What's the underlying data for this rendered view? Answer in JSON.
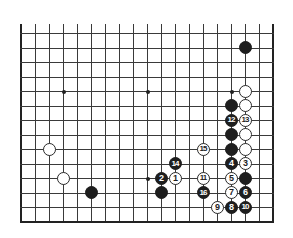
{
  "diagram": {
    "type": "go-board-partial",
    "board_size": 19,
    "visible_rows_from_bottom": 14,
    "colors": {
      "line": "#3a3a3a",
      "black": "#1e1e1e",
      "white": "#ffffff"
    },
    "star_points": [
      {
        "col": 4,
        "row": 10
      },
      {
        "col": 10,
        "row": 10
      },
      {
        "col": 16,
        "row": 10
      },
      {
        "col": 4,
        "row": 4
      },
      {
        "col": 10,
        "row": 4
      },
      {
        "col": 16,
        "row": 4
      }
    ],
    "stones": [
      {
        "color": "black",
        "col": 17,
        "row": 13,
        "label": ""
      },
      {
        "color": "white",
        "col": 17,
        "row": 10,
        "label": ""
      },
      {
        "color": "black",
        "col": 16,
        "row": 9,
        "label": ""
      },
      {
        "color": "white",
        "col": 17,
        "row": 9,
        "label": ""
      },
      {
        "color": "black",
        "col": 16,
        "row": 8,
        "label": "12"
      },
      {
        "color": "white",
        "col": 17,
        "row": 8,
        "label": "13"
      },
      {
        "color": "black",
        "col": 16,
        "row": 7,
        "label": ""
      },
      {
        "color": "white",
        "col": 17,
        "row": 7,
        "label": ""
      },
      {
        "color": "black",
        "col": 16,
        "row": 6,
        "label": ""
      },
      {
        "color": "white",
        "col": 17,
        "row": 6,
        "label": ""
      },
      {
        "color": "black",
        "col": 16,
        "row": 5,
        "label": "4"
      },
      {
        "color": "white",
        "col": 17,
        "row": 5,
        "label": "3"
      },
      {
        "color": "white",
        "col": 16,
        "row": 4,
        "label": "5"
      },
      {
        "color": "black",
        "col": 17,
        "row": 4,
        "label": ""
      },
      {
        "color": "white",
        "col": 16,
        "row": 3,
        "label": "7"
      },
      {
        "color": "black",
        "col": 17,
        "row": 3,
        "label": "6"
      },
      {
        "color": "white",
        "col": 15,
        "row": 2,
        "label": "9"
      },
      {
        "color": "black",
        "col": 16,
        "row": 2,
        "label": "8"
      },
      {
        "color": "black",
        "col": 17,
        "row": 2,
        "label": "10"
      },
      {
        "color": "white",
        "col": 14,
        "row": 6,
        "label": "15"
      },
      {
        "color": "black",
        "col": 12,
        "row": 5,
        "label": "14"
      },
      {
        "color": "black",
        "col": 11,
        "row": 4,
        "label": "2"
      },
      {
        "color": "white",
        "col": 12,
        "row": 4,
        "label": "1"
      },
      {
        "color": "white",
        "col": 14,
        "row": 4,
        "label": "11"
      },
      {
        "color": "black",
        "col": 11,
        "row": 3,
        "label": ""
      },
      {
        "color": "black",
        "col": 14,
        "row": 3,
        "label": "16"
      },
      {
        "color": "white",
        "col": 3,
        "row": 6,
        "label": ""
      },
      {
        "color": "white",
        "col": 4,
        "row": 4,
        "label": ""
      },
      {
        "color": "black",
        "col": 6,
        "row": 3,
        "label": ""
      }
    ]
  }
}
